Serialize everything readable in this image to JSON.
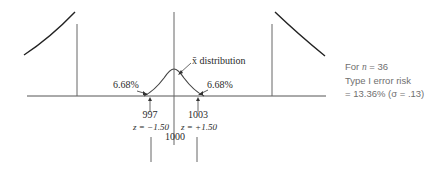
{
  "diagram": {
    "labels": {
      "distribution": "x̄ distribution",
      "left_tail_pct": "6.68%",
      "right_tail_pct": "6.68%",
      "lower_limit": "997",
      "upper_limit": "1003",
      "mean": "1000",
      "z_lower": "z = −1.50",
      "z_upper": "z = +1.50"
    },
    "note": {
      "line1_prefix": "For ",
      "line1_var": "n",
      "line1_suffix": " = 36",
      "line2": "Type I error risk",
      "line3": "= 13.36% (σ = .13)"
    },
    "colors": {
      "line": "#555555",
      "curve": "#333333",
      "text": "#2a2a2a",
      "note_text": "#6f6f6f"
    }
  }
}
